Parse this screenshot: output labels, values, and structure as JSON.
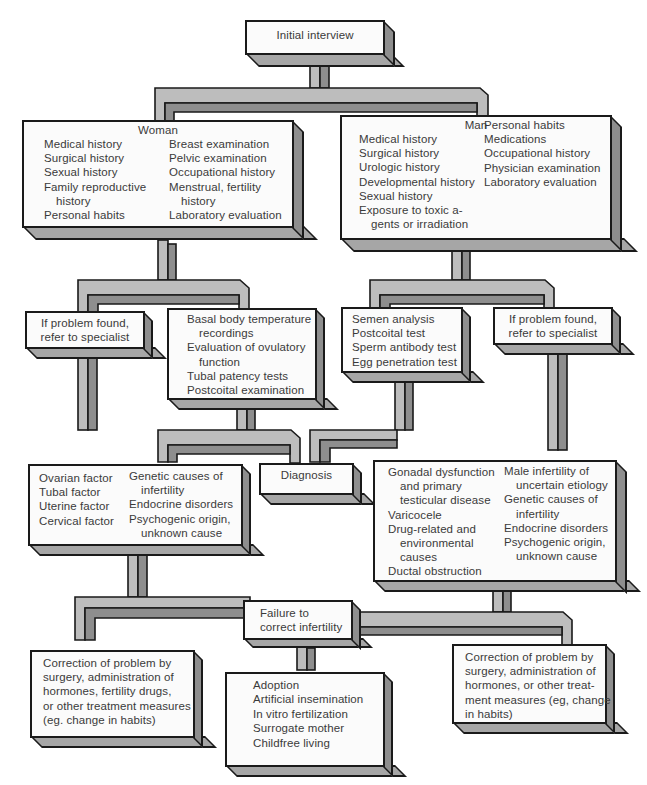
{
  "diagram": {
    "start": {
      "label": "Initial interview"
    },
    "woman_history": {
      "heading": "Woman",
      "col1": [
        "Medical history",
        "Surgical history",
        "Sexual history",
        "Family reproductive",
        "history",
        "Personal habits"
      ],
      "col2": [
        "Breast examination",
        "Pelvic examination",
        "Occupational history",
        "Menstrual, fertility",
        "history",
        "Laboratory evaluation"
      ]
    },
    "man_history": {
      "heading": "Man",
      "col1": [
        "Medical history",
        "Surgical history",
        "Urologic history",
        "Developmental history",
        "Sexual history",
        "Exposure to toxic a-",
        "gents or irradiation"
      ],
      "col2": [
        "Personal habits",
        "Medications",
        "Occupational history",
        "Physician examination",
        "Laboratory evaluation"
      ]
    },
    "woman_refer": {
      "lines": [
        "If problem found,",
        "refer to specialist"
      ]
    },
    "woman_tests": {
      "lines": [
        "Basal body temperature",
        "recordings",
        "Evaluation of ovulatory",
        "function",
        "Tubal patency tests",
        "Postcoital examination"
      ]
    },
    "man_tests": {
      "lines": [
        "Semen analysis",
        "Postcoital test",
        "Sperm antibody test",
        "Egg penetration test"
      ]
    },
    "man_refer": {
      "lines": [
        "If problem found,",
        "refer to specialist"
      ]
    },
    "diagnosis": {
      "label": "Diagnosis"
    },
    "woman_causes": {
      "col1": [
        "Ovarian factor",
        "Tubal factor",
        "Uterine factor",
        "Cervical factor"
      ],
      "col2": [
        "Genetic causes of",
        "infertility",
        "Endocrine disorders",
        "Psychogenic origin,",
        "unknown cause"
      ]
    },
    "man_causes": {
      "col1": [
        "Gonadal dysfunction",
        "and primary",
        "testicular disease",
        "Varicocele",
        "Drug-related and",
        "environmental",
        "causes",
        "Ductal obstruction"
      ],
      "col2": [
        "Male infertility of",
        "uncertain etiology",
        "Genetic causes of",
        "infertility",
        "Endocrine disorders",
        "Psychogenic origin,",
        "unknown cause"
      ]
    },
    "failure": {
      "lines": [
        "Failure to",
        "correct infertility"
      ]
    },
    "woman_treatment": {
      "lines": [
        "Correction of problem by",
        "surgery, administration of",
        "hormones, fertility drugs,",
        "or other treatment measures",
        "(eg. change in habits)"
      ]
    },
    "alternatives": {
      "lines": [
        "Adoption",
        "Artificial insemination",
        "In vitro fertilization",
        "Surrogate mother",
        "Childfree living"
      ]
    },
    "man_treatment": {
      "lines": [
        "Correction of problem by",
        "surgery, administration of",
        "hormones, or other treat-",
        "ment measures (eg, change",
        "in habits)"
      ]
    }
  },
  "colors": {
    "face": "#fbfbfb",
    "outline": "#1a1a1a",
    "pipe_light": "#bdbdbd",
    "pipe_dark": "#8e8e8e",
    "box_bottom": "#a6a6a6",
    "text": "#3a3a3a"
  }
}
